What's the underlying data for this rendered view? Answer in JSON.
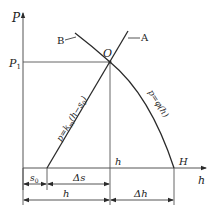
{
  "diagram": {
    "axes": {
      "y_label": "P",
      "x_label": "h"
    },
    "points": {
      "O": "O",
      "A": "A",
      "B": "B",
      "H": "H",
      "h_mark": "h",
      "P1": "P",
      "P1_sub": "1"
    },
    "curves": {
      "line_label_main": "p=k",
      "line_label_sub": "m",
      "line_label_tail": "(h−s",
      "line_label_tail_sub": "0",
      "line_label_close": ")",
      "curve_label": "p=φ(h)"
    },
    "dimensions": {
      "s0": "s",
      "s0_sub": "0",
      "delta_s": "Δs",
      "h": "h",
      "delta_h": "Δh"
    },
    "colors": {
      "line": "#2a2a2a",
      "thin": "#555555",
      "background": "#ffffff"
    }
  }
}
